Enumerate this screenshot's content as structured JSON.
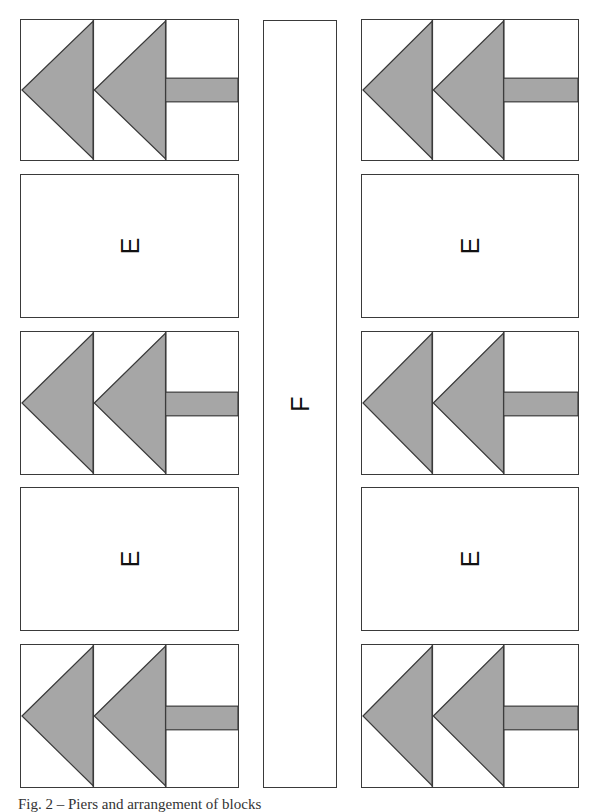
{
  "diagram": {
    "fill_color": "#a6a6a6",
    "stroke_color": "#3a3a3a",
    "column_center": {
      "label": "F",
      "x": 263,
      "y": 20,
      "width": 74,
      "height": 768
    },
    "columns": [
      {
        "side": "left",
        "blocks": [
          {
            "type": "arrow",
            "x": 20,
            "y": 19,
            "width": 219,
            "height": 142
          },
          {
            "type": "label",
            "label": "E",
            "x": 20,
            "y": 174,
            "width": 219,
            "height": 144
          },
          {
            "type": "arrow",
            "x": 20,
            "y": 331,
            "width": 219,
            "height": 144
          },
          {
            "type": "label",
            "label": "E",
            "x": 20,
            "y": 487,
            "width": 219,
            "height": 144
          },
          {
            "type": "arrow",
            "x": 20,
            "y": 644,
            "width": 219,
            "height": 144
          }
        ]
      },
      {
        "side": "right",
        "blocks": [
          {
            "type": "arrow",
            "x": 361,
            "y": 19,
            "width": 218,
            "height": 142
          },
          {
            "type": "label",
            "label": "E",
            "x": 361,
            "y": 174,
            "width": 218,
            "height": 144
          },
          {
            "type": "arrow",
            "x": 361,
            "y": 331,
            "width": 218,
            "height": 144
          },
          {
            "type": "label",
            "label": "E",
            "x": 361,
            "y": 487,
            "width": 218,
            "height": 144
          },
          {
            "type": "arrow",
            "x": 361,
            "y": 644,
            "width": 218,
            "height": 144
          }
        ]
      }
    ]
  },
  "labels": {
    "left_e1": "E",
    "left_e2": "E",
    "right_e1": "E",
    "right_e2": "E",
    "center_f": "F"
  },
  "caption": "Fig. 2 – Piers and arrangement of blocks"
}
